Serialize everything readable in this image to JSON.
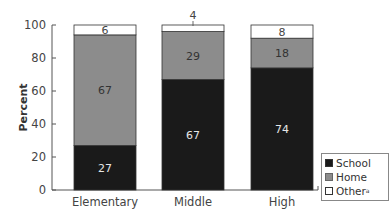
{
  "chart_data": {
    "type": "bar",
    "stacked": true,
    "title": "",
    "xlabel": "",
    "ylabel": "Percent",
    "ylim": [
      0,
      100
    ],
    "yticks": [
      0,
      20,
      40,
      60,
      80,
      100
    ],
    "categories": [
      "Elementary",
      "Middle",
      "High"
    ],
    "series": [
      {
        "name": "School",
        "values": [
          27,
          67,
          74
        ],
        "color": "#1a1a1a",
        "label_color": "#e6e6e6"
      },
      {
        "name": "Home",
        "values": [
          67,
          29,
          18
        ],
        "color": "#8c8c8c",
        "label_color": "#333333"
      },
      {
        "name": "Other",
        "name_superscript": "a",
        "values": [
          6,
          4,
          8
        ],
        "color": "#ffffff",
        "label_color": "#444444"
      }
    ],
    "grid": false,
    "legend_position": "right-bottom"
  },
  "legend": {
    "items": [
      {
        "label": "School",
        "sup": ""
      },
      {
        "label": "Home",
        "sup": ""
      },
      {
        "label": "Other",
        "sup": "a"
      }
    ]
  }
}
